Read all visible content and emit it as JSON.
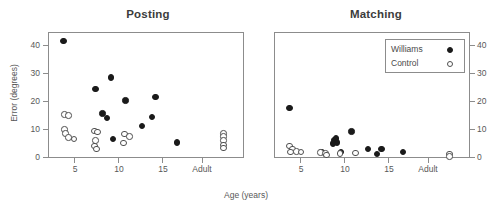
{
  "figure": {
    "xlabel": "Age (years)",
    "ylabel": "Error (degrees)",
    "background": "#ffffff",
    "frame_color": "#8c8c8c"
  },
  "legend": {
    "position": "top-right-of-matching-panel",
    "entries": [
      {
        "label": "Williams",
        "marker": "filled-circle",
        "color": "#1a1a1a"
      },
      {
        "label": "Control",
        "marker": "open-circle",
        "color": "#ffffff"
      }
    ]
  },
  "axes": {
    "yticks": [
      0,
      10,
      20,
      30,
      40
    ],
    "ytick_labels": [
      "0",
      "10",
      "20",
      "30",
      "40"
    ],
    "xticks": [
      5,
      10,
      15,
      19.5
    ],
    "xtick_labels": [
      "5",
      "10",
      "15",
      "Adult"
    ],
    "xlim": [
      2.5,
      21.5
    ],
    "ylim": [
      0,
      45
    ]
  },
  "chart_data": [
    {
      "type": "scatter",
      "title": "Posting",
      "xlabel": "Age (years)",
      "ylabel": "Error (degrees)",
      "xlim": [
        2.5,
        21.5
      ],
      "ylim": [
        0,
        45
      ],
      "grid": false,
      "xticks": [
        5,
        10,
        15,
        19.5
      ],
      "xtick_labels": [
        "5",
        "10",
        "15",
        "Adult"
      ],
      "yticks": [
        0,
        10,
        20,
        30,
        40
      ],
      "series": [
        {
          "name": "Williams",
          "marker": "filled-circle",
          "points": [
            [
              4.0,
              41.8
            ],
            [
              7.1,
              24.7
            ],
            [
              8.6,
              28.7
            ],
            [
              7.8,
              15.9
            ],
            [
              8.2,
              14.2
            ],
            [
              10.0,
              20.5
            ],
            [
              12.9,
              21.8
            ],
            [
              11.6,
              11.5
            ],
            [
              12.6,
              14.6
            ],
            [
              8.8,
              6.8
            ],
            [
              15.0,
              5.6
            ]
          ]
        },
        {
          "name": "Control",
          "marker": "open-circle",
          "points": [
            [
              4.1,
              15.5
            ],
            [
              4.5,
              15.2
            ],
            [
              4.1,
              10.2
            ],
            [
              4.2,
              8.7
            ],
            [
              4.5,
              7.4
            ],
            [
              5.0,
              6.7
            ],
            [
              7.0,
              9.6
            ],
            [
              7.3,
              9.3
            ],
            [
              7.1,
              6.3
            ],
            [
              7.0,
              4.2
            ],
            [
              7.2,
              3.3
            ],
            [
              9.9,
              8.6
            ],
            [
              9.8,
              5.3
            ],
            [
              10.4,
              7.7
            ],
            [
              19.5,
              8.8
            ],
            [
              19.5,
              7.7
            ],
            [
              19.5,
              6.3
            ],
            [
              19.5,
              4.6
            ],
            [
              19.5,
              3.5
            ]
          ]
        }
      ]
    },
    {
      "type": "scatter",
      "title": "Matching",
      "xlabel": "Age (years)",
      "ylabel": "Error (degrees)",
      "xlim": [
        2.5,
        21.5
      ],
      "ylim": [
        0,
        45
      ],
      "grid": false,
      "yaxis_side": "right",
      "xticks": [
        5,
        10,
        15,
        19.5
      ],
      "xtick_labels": [
        "5",
        "10",
        "15",
        "Adult"
      ],
      "yticks": [
        0,
        10,
        20,
        30,
        40
      ],
      "series": [
        {
          "name": "Williams",
          "marker": "filled-circle",
          "points": [
            [
              4.0,
              17.8
            ],
            [
              8.3,
              6.4
            ],
            [
              8.5,
              6.9
            ],
            [
              8.6,
              5.5
            ],
            [
              8.2,
              5.2
            ],
            [
              10.0,
              9.5
            ],
            [
              7.1,
              2.2
            ],
            [
              9.0,
              2.1
            ],
            [
              11.6,
              3.3
            ],
            [
              12.5,
              1.5
            ],
            [
              12.9,
              3.2
            ],
            [
              15.0,
              2.2
            ]
          ]
        },
        {
          "name": "Control",
          "marker": "open-circle",
          "points": [
            [
              4.0,
              4.2
            ],
            [
              4.3,
              3.3
            ],
            [
              4.1,
              2.2
            ],
            [
              4.7,
              2.4
            ],
            [
              5.1,
              2.1
            ],
            [
              7.0,
              2.0
            ],
            [
              7.5,
              1.6
            ],
            [
              7.6,
              1.1
            ],
            [
              8.9,
              1.6
            ],
            [
              10.4,
              1.8
            ],
            [
              19.5,
              1.4
            ],
            [
              19.5,
              0.5
            ]
          ]
        }
      ]
    }
  ]
}
